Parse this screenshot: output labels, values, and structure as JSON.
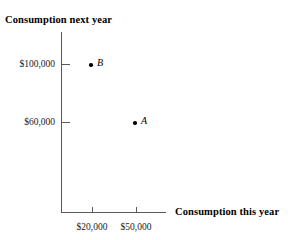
{
  "chart_data": {
    "type": "scatter",
    "title": "",
    "xlabel": "Consumption this year",
    "ylabel": "Consumption next year",
    "grid": false,
    "legend": "none",
    "xticklabels": [
      "$20,000",
      "$50,000"
    ],
    "yticklabels": [
      "$60,000",
      "$100,000"
    ],
    "xtickvalues": [
      20000,
      50000
    ],
    "ytickvalues": [
      60000,
      100000
    ],
    "xlim": [
      0,
      70000
    ],
    "ylim": [
      0,
      125000
    ],
    "points": [
      {
        "label": "A",
        "x": 50000,
        "y": 60000,
        "x_text": "$50,000",
        "y_text": "$60,000"
      },
      {
        "label": "B",
        "x": 20000,
        "y": 100000,
        "x_text": "$20,000",
        "y_text": "$100,000"
      }
    ]
  },
  "axes": {
    "y_title": "Consumption next year",
    "x_title": "Consumption this year",
    "y_ticks": [
      {
        "text": "$100,000"
      },
      {
        "text": "$60,000"
      }
    ],
    "x_ticks": [
      {
        "text": "$20,000"
      },
      {
        "text": "$50,000"
      }
    ]
  },
  "points": [
    {
      "label": "B"
    },
    {
      "label": "A"
    }
  ],
  "colors": {
    "axis": "#5a5a5a",
    "text": "#000000",
    "point": "#000000",
    "background": "#ffffff"
  }
}
